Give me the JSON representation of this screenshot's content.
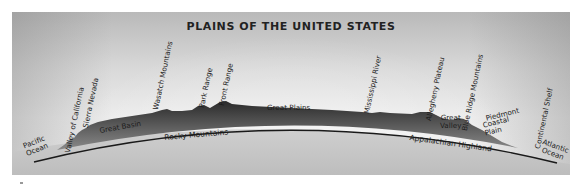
{
  "diagram": {
    "title": "PLAINS OF THE UNITED STATES",
    "type": "cross-section profile",
    "colors": {
      "sky_top": "#b9b9b9",
      "sky_bottom": "#f2f2f2",
      "earth": "#c8c8c8",
      "terrain": "#3a3a3a",
      "baseline": "#1a1a1a"
    },
    "labels_top": [
      {
        "id": "pacific-ocean",
        "text": "Pacific\nOcean"
      },
      {
        "id": "valley-of-california",
        "text": "Valley of California"
      },
      {
        "id": "sierra-nevada",
        "text": "Sierra Nevada"
      },
      {
        "id": "great-basin",
        "text": "Great Basin"
      },
      {
        "id": "wasatch-mountains",
        "text": "Wasatch Mountains"
      },
      {
        "id": "park-range",
        "text": "Park Range"
      },
      {
        "id": "front-range",
        "text": "Front Range"
      },
      {
        "id": "great-plains",
        "text": "Great Plains"
      },
      {
        "id": "mississippi-river",
        "text": "Mississippi River"
      },
      {
        "id": "allegheny-plateau",
        "text": "Allegheny Plateau"
      },
      {
        "id": "great-valley",
        "text": "Great\nValley"
      },
      {
        "id": "blue-ridge-mountains",
        "text": "Blue Ridge Mountains"
      },
      {
        "id": "piedmont",
        "text": "Piedmont"
      },
      {
        "id": "coastal-plain",
        "text": "Coastal\nPlain"
      },
      {
        "id": "continental-shelf",
        "text": "Continental Shelf"
      },
      {
        "id": "atlantic-ocean",
        "text": "Atlantic\nOcean"
      }
    ],
    "labels_bottom": [
      {
        "id": "rocky-mountains",
        "text": "Rocky Mountains"
      },
      {
        "id": "appalachian-highland",
        "text": "Appalachian Highland"
      }
    ]
  }
}
